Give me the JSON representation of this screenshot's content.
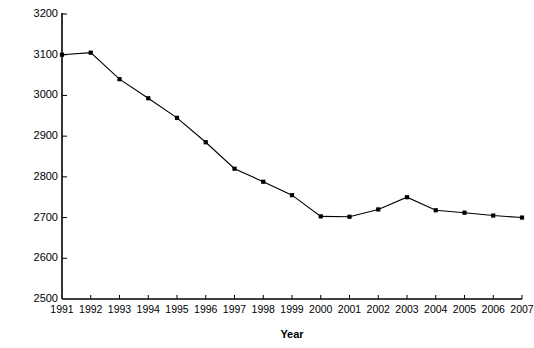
{
  "chart_data": {
    "type": "line",
    "title": "",
    "xlabel": "Year",
    "ylabel": "Thousands of Employees",
    "categories": [
      "1991",
      "1992",
      "1993",
      "1994",
      "1995",
      "1996",
      "1997",
      "1998",
      "1999",
      "2000",
      "2001",
      "2002",
      "2003",
      "2004",
      "2005",
      "2006",
      "2007"
    ],
    "x": [
      1991,
      1992,
      1993,
      1994,
      1995,
      1996,
      1997,
      1998,
      1999,
      2000,
      2001,
      2002,
      2003,
      2004,
      2005,
      2006,
      2007
    ],
    "values": [
      3100,
      3105,
      3040,
      2993,
      2945,
      2885,
      2820,
      2788,
      2755,
      2703,
      2702,
      2720,
      2750,
      2718,
      2712,
      2705,
      2700
    ],
    "series": [
      {
        "name": "Employees",
        "values": [
          3100,
          3105,
          3040,
          2993,
          2945,
          2885,
          2820,
          2788,
          2755,
          2703,
          2702,
          2720,
          2750,
          2718,
          2712,
          2705,
          2700
        ]
      }
    ],
    "ylim": [
      2500,
      3200
    ],
    "xlim": [
      1991,
      2007
    ],
    "ytick_labels": [
      "2500",
      "2600",
      "2700",
      "2800",
      "2900",
      "3000",
      "3100",
      "3200"
    ],
    "ytick_values": [
      2500,
      2600,
      2700,
      2800,
      2900,
      3000,
      3100,
      3200
    ],
    "ytick_step": 100,
    "xtick_labels": [
      "1991",
      "1992",
      "1993",
      "1994",
      "1995",
      "1996",
      "1997",
      "1998",
      "1999",
      "2000",
      "2001",
      "2002",
      "2003",
      "2004",
      "2005",
      "2006",
      "2007"
    ],
    "grid": false,
    "legend": null,
    "marker": "filled-square",
    "line_color": "#000000",
    "marker_color": "#000000",
    "axis_color": "#000000",
    "background_color": "#ffffff"
  }
}
